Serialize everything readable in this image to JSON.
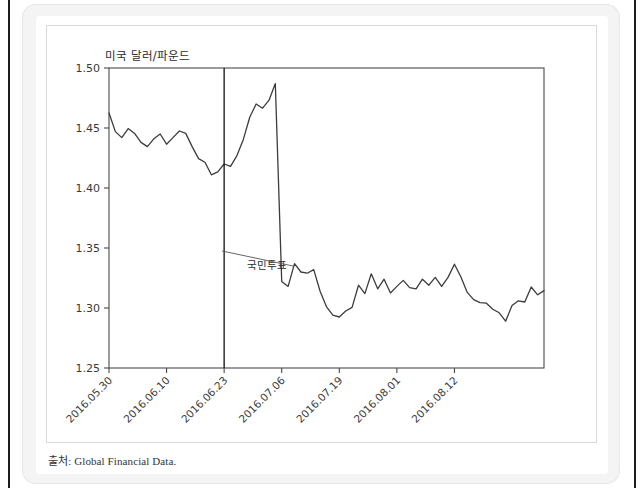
{
  "figure": {
    "source_note": "출처: Global Financial Data.",
    "axis_line_color": "#4a4a4a",
    "series_color": "#3c3c3c",
    "event_line_color": "#1f1f1f"
  },
  "chart_data": {
    "type": "line",
    "title": "",
    "ylabel": "미국 달러/파운드",
    "xlabel": "",
    "ylim": [
      1.25,
      1.5
    ],
    "ytick_labels": [
      "1.50",
      "1.45",
      "1.40",
      "1.35",
      "1.30",
      "1.25"
    ],
    "ytick_values": [
      1.5,
      1.45,
      1.4,
      1.35,
      1.3,
      1.25
    ],
    "grid": false,
    "legend": null,
    "xtick_labels": [
      "2016.05.30",
      "2016.06.10",
      "2016.06.23",
      "2016.07.19",
      "2016.07.06",
      "2016.08.01",
      "2016.08.12"
    ],
    "xtick_index": [
      0,
      9,
      18,
      27,
      36,
      45,
      54
    ],
    "xtick_labels_ordered": [
      "2016.05.30",
      "2016.06.10",
      "2016.06.23",
      "2016.07.06",
      "2016.07.19",
      "2016.08.01",
      "2016.08.12"
    ],
    "annotations": [
      {
        "label": "국민투표",
        "at_xtick": "2016.06.23",
        "at_index": 18
      }
    ],
    "series": [
      {
        "name": "미국 달러/파운드",
        "values": [
          1.4625,
          1.447,
          1.442,
          1.4495,
          1.4455,
          1.438,
          1.4345,
          1.441,
          1.445,
          1.4365,
          1.442,
          1.4475,
          1.4455,
          1.4345,
          1.4245,
          1.4215,
          1.411,
          1.4135,
          1.42,
          1.418,
          1.427,
          1.4405,
          1.459,
          1.47,
          1.4665,
          1.473,
          1.487,
          1.322,
          1.318,
          1.337,
          1.33,
          1.329,
          1.332,
          1.314,
          1.301,
          1.294,
          1.2925,
          1.2975,
          1.3005,
          1.319,
          1.312,
          1.3285,
          1.316,
          1.324,
          1.3125,
          1.318,
          1.323,
          1.317,
          1.316,
          1.324,
          1.319,
          1.3255,
          1.318,
          1.3255,
          1.3365,
          1.326,
          1.313,
          1.307,
          1.3045,
          1.304,
          1.299,
          1.296,
          1.289,
          1.302,
          1.306,
          1.305,
          1.3175,
          1.311,
          1.3145
        ]
      }
    ]
  }
}
